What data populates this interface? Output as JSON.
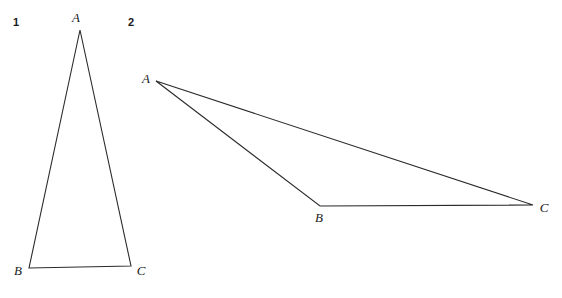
{
  "figure": {
    "background_color": "#ffffff",
    "line_color": "#2b2b2b",
    "text_color": "#1a1a1a",
    "width": 562,
    "height": 298,
    "panels": [
      {
        "number": "1",
        "number_pos": {
          "x": 16,
          "y": 26
        },
        "description": "tall narrow triangle",
        "vertices": [
          {
            "label": "A",
            "x": 80,
            "y": 30,
            "label_x": 76,
            "label_y": 22,
            "anchor": "middle"
          },
          {
            "label": "B",
            "x": 29,
            "y": 268,
            "label_x": 18,
            "label_y": 275,
            "anchor": "middle"
          },
          {
            "label": "C",
            "x": 131,
            "y": 266,
            "label_x": 141,
            "label_y": 275,
            "anchor": "middle"
          }
        ],
        "path": "M 80 30 L 29 268 L 131 266 Z"
      },
      {
        "number": "2",
        "number_pos": {
          "x": 131,
          "y": 26
        },
        "description": "wide obtuse triangle",
        "vertices": [
          {
            "label": "A",
            "x": 156,
            "y": 81,
            "label_x": 146,
            "label_y": 83,
            "anchor": "middle"
          },
          {
            "label": "B",
            "x": 320,
            "y": 206,
            "label_x": 319,
            "label_y": 222,
            "anchor": "middle"
          },
          {
            "label": "C",
            "x": 533,
            "y": 205,
            "label_x": 544,
            "label_y": 212,
            "anchor": "middle"
          }
        ],
        "path": "M 156 81 L 320 206 L 533 205 Z"
      }
    ]
  }
}
